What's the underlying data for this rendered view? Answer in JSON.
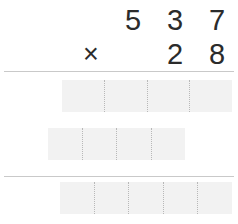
{
  "problem": {
    "type": "long-multiplication",
    "multiplicand": "537",
    "multiplier": "28",
    "operator": "×",
    "multiplicand_digits": [
      "5",
      "3",
      "7"
    ],
    "multiplier_digits": [
      "2",
      "8"
    ],
    "multiplier_row_leading_blank": ""
  },
  "colors": {
    "digit": "#2b2b2b",
    "answer_box_fill": "#f2f2f2",
    "divider_dotted": "#b8b8b8",
    "rule": "#c9c9c9",
    "background": "#ffffff"
  },
  "answer_rows": [
    {
      "name": "partial-product-1",
      "cells": [
        "",
        "",
        "",
        ""
      ]
    },
    {
      "name": "partial-product-2",
      "cells": [
        "",
        "",
        "",
        ""
      ]
    },
    {
      "name": "final-total",
      "cells": [
        "",
        "",
        "",
        "",
        ""
      ]
    }
  ]
}
